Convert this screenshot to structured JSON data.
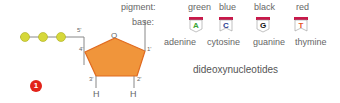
{
  "diagram": {
    "step_badge": "1",
    "title": "dideoxynucleotides",
    "labels": {
      "pigment": "pigment:",
      "base": "base:",
      "ring_oxygen": "O",
      "c5": "5'",
      "c4": "4'",
      "c3": "3'",
      "c2": "2'",
      "c1": "1'",
      "h3": "H",
      "h2": "H"
    },
    "colors": {
      "sugar": "#f0953b",
      "sugar_edge": "#e06a1f",
      "phosphate": "#d6d83a",
      "tag_top": "#c8184a",
      "badge": "#e2231a"
    },
    "nucleotides": [
      {
        "pigment": "green",
        "letter": "A",
        "base": "adenine",
        "color": "#3aa534"
      },
      {
        "pigment": "blue",
        "letter": "C",
        "base": "cytosine",
        "color": "#2b3d8f"
      },
      {
        "pigment": "black",
        "letter": "G",
        "base": "guanine",
        "color": "#111111"
      },
      {
        "pigment": "red",
        "letter": "T",
        "base": "thymine",
        "color": "#e8511f"
      }
    ]
  }
}
